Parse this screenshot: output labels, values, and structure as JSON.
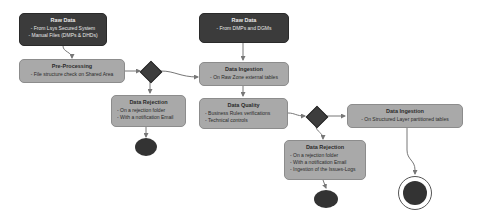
{
  "diagram": {
    "colors": {
      "dark_node": "#3b3b3b",
      "light_node": "#a9a9a9",
      "decision": "#3d3d3d",
      "edge": "#777777"
    },
    "nodes": {
      "raw_data_1": {
        "title": "Raw Data",
        "lines": [
          "- From Lsys Secured System",
          "- Manual Files (DMPs & DHDs)"
        ]
      },
      "pre_processing": {
        "title": "Pre-Processing",
        "lines": [
          "- File structure check on Shared Area"
        ]
      },
      "data_rejection_1": {
        "title": "Data Rejection",
        "lines": [
          "- On a rejection folder",
          "- With a notification Email"
        ]
      },
      "raw_data_2": {
        "title": "Raw Data",
        "lines": [
          "- From DMPs and DGMs"
        ]
      },
      "data_ingestion_1": {
        "title": "Data Ingestion",
        "lines": [
          "- On Raw Zone external tables"
        ]
      },
      "data_quality": {
        "title": "Data Quality",
        "lines": [
          "- Business Rules verifications",
          "- Technical controls"
        ]
      },
      "data_ingestion_2": {
        "title": "Data Ingestion",
        "lines": [
          "- On Structured Layer partitioned tables"
        ]
      },
      "data_rejection_2": {
        "title": "Data Rejection",
        "lines": [
          "- On a rejection folder",
          "- With a notification Email",
          "- Ingestion of the Issues-Logs"
        ]
      }
    },
    "decisions": [
      "decision-1",
      "decision-2"
    ],
    "end_nodes": [
      "end-rejection-1",
      "end-rejection-2",
      "final-end"
    ]
  }
}
